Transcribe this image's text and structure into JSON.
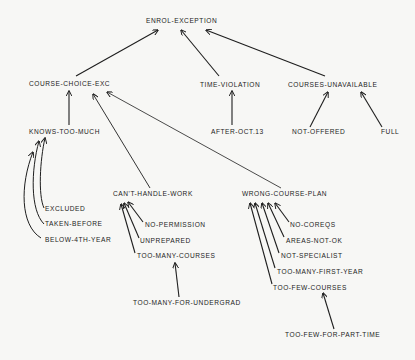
{
  "diagram": {
    "type": "hierarchy-tree",
    "root": "ENROL-EXCEPTION",
    "colors": {
      "background": "#f7f7f5",
      "ink": "#1c1c1c"
    },
    "nodes": {
      "enrol_exception": {
        "label": "ENROL-EXCEPTION",
        "x": 146,
        "y": 21
      },
      "course_choice_exc": {
        "label": "COURSE-CHOICE-EXC",
        "x": 29,
        "y": 84
      },
      "time_violation": {
        "label": "TIME-VIOLATION",
        "x": 200,
        "y": 85
      },
      "courses_unavailable": {
        "label": "COURSES-UNAVAILABLE",
        "x": 288,
        "y": 85
      },
      "knows_too_much": {
        "label": "KNOWS-TOO-MUCH",
        "x": 29,
        "y": 132
      },
      "after_oct_13": {
        "label": "AFTER-OCT.13",
        "x": 211,
        "y": 132
      },
      "not_offered": {
        "label": "NOT-OFFERED",
        "x": 292,
        "y": 132
      },
      "full": {
        "label": "FULL",
        "x": 381,
        "y": 132
      },
      "cant_handle_work": {
        "label": "CAN'T-HANDLE-WORK",
        "x": 113,
        "y": 194
      },
      "wrong_course_plan": {
        "label": "WRONG-COURSE-PLAN",
        "x": 242,
        "y": 194
      },
      "excluded": {
        "label": "EXCLUDED",
        "x": 45,
        "y": 209
      },
      "taken_before": {
        "label": "TAKEN-BEFORE",
        "x": 45,
        "y": 224
      },
      "below_4th_year": {
        "label": "BELOW-4TH-YEAR",
        "x": 45,
        "y": 240
      },
      "no_permission": {
        "label": "NO-PERMISSION",
        "x": 145,
        "y": 225
      },
      "unprepared": {
        "label": "UNPREPARED",
        "x": 140,
        "y": 241
      },
      "too_many_courses": {
        "label": "TOO-MANY-COURSES",
        "x": 137,
        "y": 256
      },
      "too_many_for_undergrad": {
        "label": "TOO-MANY-FOR-UNDERGRAD",
        "x": 133,
        "y": 303
      },
      "no_coreqs": {
        "label": "NO-COREQS",
        "x": 290,
        "y": 225
      },
      "areas_not_ok": {
        "label": "AREAS-NOT-OK",
        "x": 286,
        "y": 241
      },
      "not_specialist": {
        "label": "NOT-SPECIALIST",
        "x": 281,
        "y": 256
      },
      "too_many_first_year": {
        "label": "TOO-MANY-FIRST-YEAR",
        "x": 277,
        "y": 272
      },
      "too_few_courses": {
        "label": "TOO-FEW-COURSES",
        "x": 273,
        "y": 288
      },
      "too_few_for_part_time": {
        "label": "TOO-FEW-FOR-PART-TIME",
        "x": 285,
        "y": 335
      }
    },
    "edges": [
      {
        "from": "COURSE-CHOICE-EXC",
        "to": "ENROL-EXCEPTION"
      },
      {
        "from": "TIME-VIOLATION",
        "to": "ENROL-EXCEPTION"
      },
      {
        "from": "COURSES-UNAVAILABLE",
        "to": "ENROL-EXCEPTION"
      },
      {
        "from": "KNOWS-TOO-MUCH",
        "to": "COURSE-CHOICE-EXC"
      },
      {
        "from": "CAN'T-HANDLE-WORK",
        "to": "COURSE-CHOICE-EXC"
      },
      {
        "from": "WRONG-COURSE-PLAN",
        "to": "COURSE-CHOICE-EXC"
      },
      {
        "from": "AFTER-OCT.13",
        "to": "TIME-VIOLATION"
      },
      {
        "from": "NOT-OFFERED",
        "to": "COURSES-UNAVAILABLE"
      },
      {
        "from": "FULL",
        "to": "COURSES-UNAVAILABLE"
      },
      {
        "from": "EXCLUDED",
        "to": "KNOWS-TOO-MUCH"
      },
      {
        "from": "TAKEN-BEFORE",
        "to": "KNOWS-TOO-MUCH"
      },
      {
        "from": "BELOW-4TH-YEAR",
        "to": "KNOWS-TOO-MUCH"
      },
      {
        "from": "NO-PERMISSION",
        "to": "CAN'T-HANDLE-WORK"
      },
      {
        "from": "UNPREPARED",
        "to": "CAN'T-HANDLE-WORK"
      },
      {
        "from": "TOO-MANY-COURSES",
        "to": "CAN'T-HANDLE-WORK"
      },
      {
        "from": "TOO-MANY-FOR-UNDERGRAD",
        "to": "TOO-MANY-COURSES"
      },
      {
        "from": "NO-COREQS",
        "to": "WRONG-COURSE-PLAN"
      },
      {
        "from": "AREAS-NOT-OK",
        "to": "WRONG-COURSE-PLAN"
      },
      {
        "from": "NOT-SPECIALIST",
        "to": "WRONG-COURSE-PLAN"
      },
      {
        "from": "TOO-MANY-FIRST-YEAR",
        "to": "WRONG-COURSE-PLAN"
      },
      {
        "from": "TOO-FEW-COURSES",
        "to": "WRONG-COURSE-PLAN"
      },
      {
        "from": "TOO-FEW-FOR-PART-TIME",
        "to": "TOO-FEW-COURSES"
      }
    ]
  }
}
